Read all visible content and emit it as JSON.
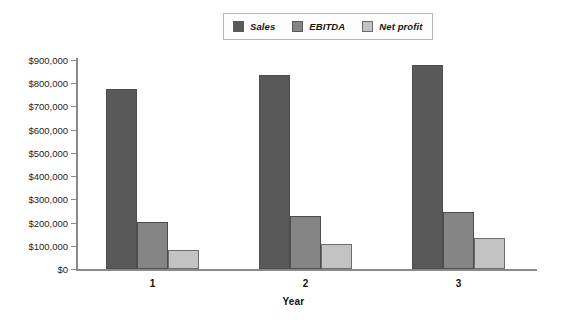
{
  "legend": {
    "position": "top-center",
    "entries": [
      {
        "label": "Sales",
        "color": "#595959",
        "swatch_name": "legend-swatch-sales"
      },
      {
        "label": "EBITDA",
        "color": "#858585",
        "swatch_name": "legend-swatch-ebitda"
      },
      {
        "label": "Net profit",
        "color": "#c3c3c3",
        "swatch_name": "legend-swatch-net-profit"
      }
    ]
  },
  "axes": {
    "x_title": "Year",
    "y_ticks": [
      "$0",
      "$100,000",
      "$200,000",
      "$300,000",
      "$400,000",
      "$500,000",
      "$600,000",
      "$700,000",
      "$800,000",
      "$900,000"
    ],
    "x_ticks": [
      "1",
      "2",
      "3"
    ]
  },
  "chart_data": {
    "type": "bar",
    "title": "",
    "subtitle": "",
    "xlabel": "Year",
    "ylabel": "",
    "categories": [
      "1",
      "2",
      "3"
    ],
    "series": [
      {
        "name": "Sales",
        "color": "#595959",
        "values": [
          775000,
          835000,
          880000
        ]
      },
      {
        "name": "EBITDA",
        "color": "#858585",
        "values": [
          202000,
          228000,
          245000
        ]
      },
      {
        "name": "Net profit",
        "color": "#c3c3c3",
        "values": [
          82000,
          108000,
          133000
        ]
      }
    ],
    "ylim": [
      0,
      900000
    ],
    "ytick_step": 100000,
    "ytick_format": "$#,##0",
    "grid": false,
    "legend_position": "top-center",
    "orientation": "vertical",
    "grouping": "clustered"
  }
}
